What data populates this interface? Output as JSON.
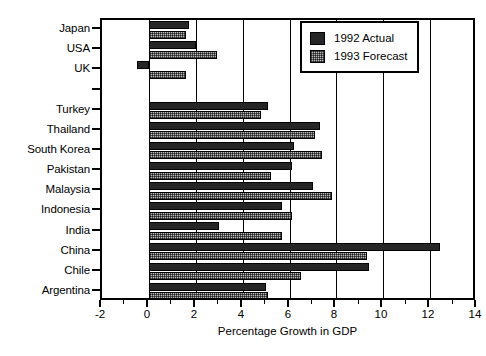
{
  "chart_data": {
    "type": "bar",
    "orientation": "horizontal",
    "title": "",
    "xlabel": "Percentage Growth in GDP",
    "ylabel": "",
    "xlim": [
      -2,
      14
    ],
    "xticks": [
      -2,
      0,
      2,
      4,
      6,
      8,
      10,
      12,
      14
    ],
    "xticklabels": [
      "-2",
      "0",
      "2",
      "4",
      "6",
      "8",
      "10",
      "12",
      "14"
    ],
    "minor_tick_interval": 1,
    "grid": "vertical-major",
    "legend_position": "upper right",
    "categories": [
      "Japan",
      "USA",
      "UK",
      "",
      "Turkey",
      "Thailand",
      "South Korea",
      "Pakistan",
      "Malaysia",
      "Indonesia",
      "India",
      "China",
      "Chile",
      "Argentina"
    ],
    "series": [
      {
        "name": "1992 Actual",
        "color": "#262626",
        "values": [
          1.7,
          2.0,
          -0.5,
          null,
          5.1,
          7.3,
          6.2,
          6.1,
          7.0,
          5.7,
          3.0,
          12.4,
          9.4,
          5.0
        ]
      },
      {
        "name": "1993 Forecast",
        "color": "#b8b8b8",
        "values": [
          1.6,
          2.9,
          1.6,
          null,
          4.8,
          7.1,
          7.4,
          5.2,
          7.8,
          6.1,
          5.7,
          9.3,
          6.5,
          5.1
        ]
      }
    ]
  },
  "legend": {
    "entries": [
      {
        "label": "1992 Actual",
        "swatch": "solid-dark"
      },
      {
        "label": "1993 Forecast",
        "swatch": "hatched-light"
      }
    ]
  },
  "axis": {
    "x_title": "Percentage Growth in GDP"
  }
}
